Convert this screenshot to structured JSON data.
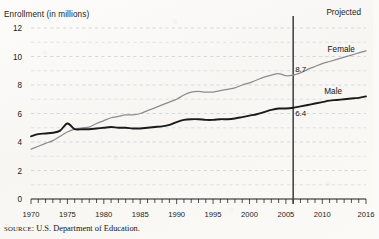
{
  "figure": {
    "y_axis_title": "Enrollment (in millions)",
    "projected_label": "Projected",
    "source_prefix": "SOURCE",
    "source_text": ": U.S. Department of Education."
  },
  "colors": {
    "female_line": "#8c8c8c",
    "male_line": "#1a1a1a",
    "grid": "#b9c4cf",
    "axis": "#1a1a1a",
    "divider": "#3b3b3b",
    "paper": "#fbfaf8"
  },
  "chart_data": {
    "type": "line",
    "title": "",
    "subtitle": "",
    "xlabel": "",
    "ylabel": "Enrollment (in millions)",
    "xlim": [
      1970,
      2016
    ],
    "ylim": [
      0,
      12
    ],
    "ytick_labels": [
      "0",
      "2",
      "4",
      "6",
      "8",
      "10",
      "12"
    ],
    "ytick_values": [
      0,
      2,
      4,
      6,
      8,
      10,
      12
    ],
    "gridlines_every": 1,
    "grid": true,
    "xtick_labels": [
      "1970",
      "1975",
      "1980",
      "1985",
      "1990",
      "1995",
      "2000",
      "2005",
      "2010",
      "2016"
    ],
    "xtick_values": [
      1970,
      1975,
      1980,
      1985,
      1990,
      1995,
      2000,
      2005,
      2010,
      2016
    ],
    "minor_ticks_every": 1,
    "legend_position": "inline-right",
    "annotations": [
      {
        "name": "projected-divider",
        "type": "vline",
        "x": 2006,
        "label": "Projected"
      },
      {
        "name": "female-value-label",
        "text": "8.7",
        "x": 2006,
        "y": 8.7
      },
      {
        "name": "male-value-label",
        "text": "6.4",
        "x": 2006,
        "y": 6.4
      }
    ],
    "x": [
      1970,
      1971,
      1972,
      1973,
      1974,
      1975,
      1976,
      1977,
      1978,
      1979,
      1980,
      1981,
      1982,
      1983,
      1984,
      1985,
      1986,
      1987,
      1988,
      1989,
      1990,
      1991,
      1992,
      1993,
      1994,
      1995,
      1996,
      1997,
      1998,
      1999,
      2000,
      2001,
      2002,
      2003,
      2004,
      2005,
      2006,
      2007,
      2008,
      2009,
      2010,
      2011,
      2012,
      2013,
      2014,
      2015,
      2016
    ],
    "series": [
      {
        "name": "Male",
        "label": "Male",
        "color": "#1a1a1a",
        "values": [
          4.4,
          4.55,
          4.6,
          4.65,
          4.8,
          5.3,
          4.9,
          4.9,
          4.9,
          4.95,
          5.0,
          5.05,
          5.0,
          5.0,
          4.95,
          4.95,
          5.0,
          5.05,
          5.1,
          5.2,
          5.4,
          5.55,
          5.6,
          5.6,
          5.55,
          5.55,
          5.6,
          5.6,
          5.65,
          5.75,
          5.85,
          5.95,
          6.1,
          6.25,
          6.35,
          6.35,
          6.4,
          6.5,
          6.6,
          6.7,
          6.8,
          6.9,
          6.95,
          7.0,
          7.05,
          7.1,
          7.2
        ]
      },
      {
        "name": "Female",
        "label": "Female",
        "color": "#8c8c8c",
        "values": [
          3.5,
          3.7,
          3.9,
          4.1,
          4.4,
          4.7,
          4.9,
          5.0,
          5.05,
          5.3,
          5.5,
          5.7,
          5.8,
          5.9,
          5.9,
          6.0,
          6.2,
          6.4,
          6.6,
          6.8,
          7.0,
          7.3,
          7.5,
          7.55,
          7.5,
          7.5,
          7.6,
          7.7,
          7.8,
          8.0,
          8.15,
          8.35,
          8.55,
          8.7,
          8.8,
          8.65,
          8.7,
          8.85,
          9.1,
          9.3,
          9.5,
          9.65,
          9.8,
          9.95,
          10.1,
          10.25,
          10.4
        ]
      }
    ]
  }
}
